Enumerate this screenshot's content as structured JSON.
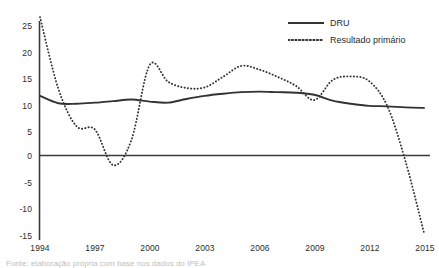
{
  "chart_data": {
    "type": "line",
    "title": "",
    "subtitle": "",
    "xlabel": "",
    "ylabel": "",
    "xlim": [
      1994,
      2015
    ],
    "ylim": [
      -15,
      27
    ],
    "yticks": [
      25,
      20,
      15,
      10,
      5,
      0,
      -5,
      -10,
      -15
    ],
    "xticks": [
      1994,
      1997,
      2000,
      2003,
      2006,
      2009,
      2012,
      2015
    ],
    "xtick_labels": [
      "1994",
      "1997",
      "2000",
      "2003",
      "2006",
      "2009",
      "2012",
      "2015"
    ],
    "ytick_labels": [
      "25",
      "20",
      "15",
      "10",
      "5",
      "0",
      "-5",
      "-10",
      "-15"
    ],
    "grid": false,
    "zero_line": 0,
    "legend_position": "top-right",
    "x": [
      1994,
      1995,
      1996,
      1997,
      1998,
      1999,
      2000,
      2001,
      2002,
      2003,
      2004,
      2005,
      2006,
      2007,
      2008,
      2009,
      2010,
      2011,
      2012,
      2013,
      2014,
      2015
    ],
    "series": [
      {
        "name": "DRU",
        "style": "solid",
        "color": "#333333",
        "values": [
          11.6,
          10.2,
          10.1,
          10.3,
          10.6,
          10.9,
          10.5,
          10.3,
          11.0,
          11.6,
          12.0,
          12.3,
          12.4,
          12.3,
          12.2,
          11.8,
          10.7,
          10.1,
          9.7,
          9.6,
          9.4,
          9.3
        ]
      },
      {
        "name": "Resultado primário",
        "style": "dotted",
        "color": "#333333",
        "values": [
          26.6,
          13.0,
          5.8,
          5.2,
          -1.6,
          3.2,
          17.5,
          14.3,
          13.1,
          13.2,
          15.2,
          17.3,
          16.6,
          15.2,
          13.5,
          10.8,
          14.6,
          15.3,
          14.4,
          9.6,
          -1.0,
          -14.5
        ]
      }
    ]
  },
  "axis": {
    "y_ticks": [
      "25",
      "20",
      "15",
      "10",
      "5",
      "0",
      "-5",
      "-10",
      "-15"
    ],
    "x_ticks": [
      "1994",
      "1997",
      "2000",
      "2003",
      "2006",
      "2009",
      "2012",
      "2015"
    ]
  },
  "legend": {
    "items": [
      {
        "label": "DRU",
        "style": "solid"
      },
      {
        "label": "Resultado primário",
        "style": "dotted"
      }
    ]
  },
  "caption": {
    "text": "Fonte: elaboração própria com base nos dados do IPEA"
  }
}
